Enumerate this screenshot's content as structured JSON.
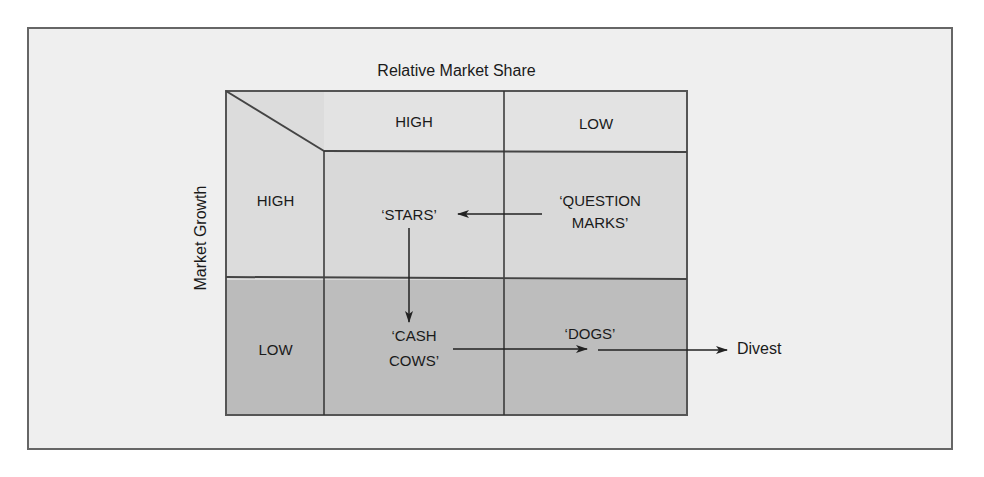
{
  "diagram": {
    "type": "BCG growth-share matrix",
    "x_axis_title": "Relative Market Share",
    "y_axis_title": "Market Growth",
    "column_headers": [
      "HIGH",
      "LOW"
    ],
    "row_headers": [
      "HIGH",
      "LOW"
    ],
    "quadrants": {
      "high_growth_high_share": {
        "line1": "‘STARS’"
      },
      "high_growth_low_share": {
        "line1": "‘QUESTION",
        "line2": "MARKS’"
      },
      "low_growth_high_share": {
        "line1": "‘CASH",
        "line2": "COWS’"
      },
      "low_growth_low_share": {
        "line1": "‘DOGS’"
      }
    },
    "exit_label": "Divest",
    "flows": [
      {
        "from": "QUESTION MARKS",
        "to": "STARS"
      },
      {
        "from": "STARS",
        "to": "CASH COWS"
      },
      {
        "from": "CASH COWS",
        "to": "DOGS"
      },
      {
        "from": "DOGS",
        "to": "Divest"
      }
    ],
    "colors": {
      "page_background": "#ffffff",
      "frame_background": "#efefef",
      "frame_border": "#666666",
      "header_row": "#e3e3e3",
      "high_growth_row": "#d9d9d9",
      "low_growth_row": "#bdbdbd",
      "lines": "#333333"
    }
  }
}
